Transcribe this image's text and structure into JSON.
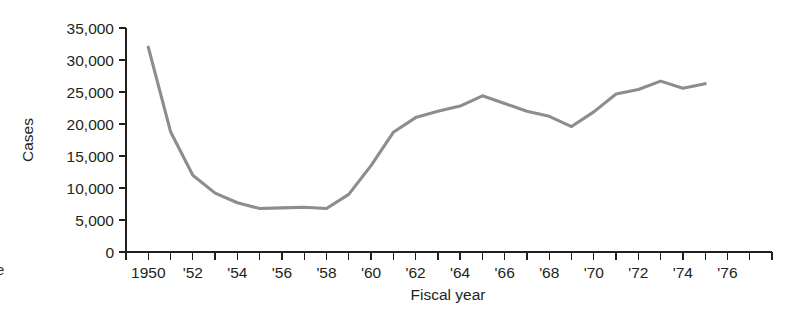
{
  "figure": {
    "margin_glyph": "e",
    "background_color": "#ffffff",
    "width": 800,
    "height": 318
  },
  "chart_data": {
    "type": "line",
    "title": "",
    "subtitle": "",
    "xlabel": "Fiscal year",
    "ylabel": "Cases",
    "grid": false,
    "legend": false,
    "line_color": "#8d8d8d",
    "axis_color": "#231f20",
    "xlim": [
      1949,
      1978
    ],
    "ylim": [
      0,
      35000
    ],
    "x_tick_interval": 1,
    "x_label_interval": 2,
    "y_tick_values": [
      0,
      5000,
      10000,
      15000,
      20000,
      25000,
      30000,
      35000
    ],
    "y_tick_labels": [
      "0",
      "5,000",
      "10,000",
      "15,000",
      "20,000",
      "25,000",
      "30,000",
      "35,000"
    ],
    "x_tick_values": [
      1949,
      1950,
      1951,
      1952,
      1953,
      1954,
      1955,
      1956,
      1957,
      1958,
      1959,
      1960,
      1961,
      1962,
      1963,
      1964,
      1965,
      1966,
      1967,
      1968,
      1969,
      1970,
      1971,
      1972,
      1973,
      1974,
      1975,
      1976,
      1977,
      1978
    ],
    "x_tick_labels": [
      "1950",
      "'52",
      "'54",
      "'56",
      "'58",
      "'60",
      "'62",
      "'64",
      "'66",
      "'68",
      "'70",
      "'72",
      "'74",
      "'76"
    ],
    "x_tick_label_values": [
      1950,
      1952,
      1954,
      1956,
      1958,
      1960,
      1962,
      1964,
      1966,
      1968,
      1970,
      1972,
      1974,
      1976
    ],
    "x": [
      1950,
      1951,
      1952,
      1953,
      1954,
      1955,
      1956,
      1957,
      1958,
      1959,
      1960,
      1961,
      1962,
      1963,
      1964,
      1965,
      1966,
      1967,
      1968,
      1969,
      1970,
      1971,
      1972,
      1973,
      1974,
      1975
    ],
    "values": [
      32000,
      18800,
      12000,
      9200,
      7700,
      6800,
      6900,
      7000,
      6800,
      9000,
      13500,
      18700,
      21000,
      22000,
      22800,
      24400,
      23200,
      22000,
      21200,
      19600,
      21900,
      24700,
      25400,
      26700,
      25600,
      26300
    ],
    "series": [
      {
        "name": "Cases",
        "values": [
          32000,
          18800,
          12000,
          9200,
          7700,
          6800,
          6900,
          7000,
          6800,
          9000,
          13500,
          18700,
          21000,
          22000,
          22800,
          24400,
          23200,
          22000,
          21200,
          19600,
          21900,
          24700,
          25400,
          26700,
          25600,
          26300
        ]
      }
    ],
    "annotations": []
  }
}
